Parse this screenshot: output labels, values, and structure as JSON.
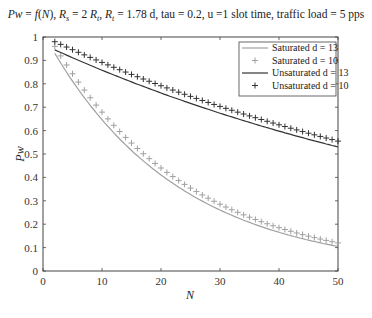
{
  "chart_data": {
    "type": "line",
    "title": "Pw = f(N), Rs = 2 Rt, Rt = 1.78 d, tau = 0.2, u =1 slot time, traffic load = 5 pps",
    "xlabel": "N",
    "ylabel": "Pw",
    "xlim": [
      0,
      50
    ],
    "ylim": [
      0,
      1
    ],
    "xticks": [
      0,
      10,
      20,
      30,
      40,
      50
    ],
    "yticks": [
      0,
      0.1,
      0.2,
      0.3,
      0.4,
      0.5,
      0.6,
      0.7,
      0.8,
      0.9,
      1
    ],
    "grid": false,
    "legend_position": "upper right",
    "series": [
      {
        "name": "Saturated d = 13",
        "style": "line",
        "color": "#a0a0a0",
        "x_start": 2,
        "x_end": 50,
        "y_start": 0.93,
        "y_end": 0.105
      },
      {
        "name": "Saturated d = 10",
        "style": "plus-markers",
        "color": "#a0a0a0",
        "x_start": 2,
        "x_end": 50,
        "y_start": 0.96,
        "y_end": 0.12
      },
      {
        "name": "Unsaturated d = 13",
        "style": "line",
        "color": "#333333",
        "x_start": 2,
        "x_end": 50,
        "y_start": 0.945,
        "y_end": 0.53
      },
      {
        "name": "Unsaturated d = 10",
        "style": "plus-markers",
        "color": "#333333",
        "x_start": 2,
        "x_end": 50,
        "y_start": 0.98,
        "y_end": 0.555
      }
    ]
  },
  "title": {
    "pre": "Pw = ",
    "fn": "f(N)",
    "rest": ", Rs = 2 Rt, Rt = 1.78 d, tau = 0.2, u =1 slot time, traffic load = 5 pps"
  },
  "axes": {
    "xlabel": "N",
    "ylabel": "Pw",
    "xticks": [
      "0",
      "10",
      "20",
      "30",
      "40",
      "50"
    ],
    "yticks": [
      "0",
      "0.1",
      "0.2",
      "0.3",
      "0.4",
      "0.5",
      "0.6",
      "0.7",
      "0.8",
      "0.9",
      "1"
    ]
  },
  "legend": [
    "Saturated d = 13",
    "Saturated d = 10",
    "Unsaturated d = 13",
    "Unsaturated d = 10"
  ]
}
